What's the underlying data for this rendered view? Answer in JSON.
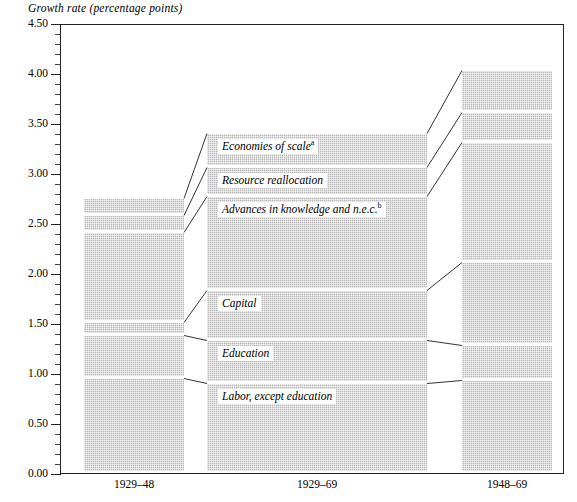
{
  "chart_data": {
    "type": "bar",
    "subtype": "stacked",
    "title": "",
    "ylabel": "Growth rate (percentage points)",
    "xlabel": "",
    "ylim": [
      0.0,
      4.5
    ],
    "ytick_step": 0.5,
    "yminor_step": 0.1,
    "grid": false,
    "legend": "inline-labels-on-segments",
    "categories": [
      "1929–48",
      "1929–69",
      "1948–69"
    ],
    "series": [
      {
        "name": "Labor, except education",
        "values": [
          0.95,
          0.9,
          0.93
        ]
      },
      {
        "name": "Education",
        "values": [
          0.43,
          0.43,
          0.35
        ]
      },
      {
        "name": "Capital",
        "values": [
          0.13,
          0.5,
          0.83
        ]
      },
      {
        "name": "Advances in knowledge and n.e.c.",
        "values": [
          0.9,
          0.94,
          1.2
        ]
      },
      {
        "name": "Resource reallocation",
        "values": [
          0.17,
          0.29,
          0.3
        ]
      },
      {
        "name": "Economies of scale",
        "values": [
          0.17,
          0.34,
          0.42
        ]
      }
    ],
    "totals": [
      2.75,
      3.4,
      4.03
    ],
    "ytick_labels": [
      "0.00",
      "0.50",
      "1.00",
      "1.50",
      "2.00",
      "2.50",
      "3.00",
      "3.50",
      "4.00",
      "4.50"
    ],
    "footnote_markers": {
      "Economies of scale": "a",
      "Advances in knowledge and n.e.c.": "b"
    }
  },
  "axis": {
    "title": "Growth rate (percentage points)",
    "ticks": [
      {
        "label": "4.50",
        "value": 4.5
      },
      {
        "label": "4.00",
        "value": 4.0
      },
      {
        "label": "3.50",
        "value": 3.5
      },
      {
        "label": "3.00",
        "value": 3.0
      },
      {
        "label": "2.50",
        "value": 2.5
      },
      {
        "label": "2.00",
        "value": 2.0
      },
      {
        "label": "1.50",
        "value": 1.5
      },
      {
        "label": "1.00",
        "value": 1.0
      },
      {
        "label": "0.50",
        "value": 0.5
      },
      {
        "label": "0.00",
        "value": 0.0
      }
    ]
  },
  "xaxis": {
    "labels": [
      "1929–48",
      "1929–69",
      "1948–69"
    ]
  },
  "plates": [
    {
      "text": "Economies of scale",
      "sup": "a"
    },
    {
      "text": "Resource reallocation",
      "sup": ""
    },
    {
      "text": "Advances in knowledge and n.e.c.",
      "sup": "b"
    },
    {
      "text": "Capital",
      "sup": ""
    },
    {
      "text": "Education",
      "sup": ""
    },
    {
      "text": "Labor, except education",
      "sup": ""
    }
  ],
  "colors": {
    "bar_fill": "#b8b8b8",
    "frame": "#222222",
    "text": "#000000",
    "background": "#ffffff"
  }
}
